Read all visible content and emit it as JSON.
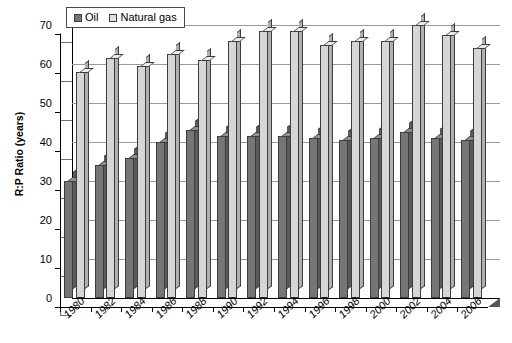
{
  "chart_data": {
    "type": "bar",
    "title": "",
    "subtitle": "",
    "xlabel": "",
    "ylabel": "R:P Ratio (years)",
    "ylim": [
      0,
      70
    ],
    "yticks": [
      0,
      10,
      20,
      30,
      40,
      50,
      60,
      70
    ],
    "grid": true,
    "legend_position": "top-left",
    "style": "3d-clustered-column",
    "categories": [
      "1980",
      "1982",
      "1984",
      "1986",
      "1988",
      "1990",
      "1992",
      "1994",
      "1996",
      "1998",
      "2000",
      "2002",
      "2004",
      "2006"
    ],
    "series": [
      {
        "name": "Oil",
        "color": "#767676",
        "values": [
          30,
          34,
          36,
          40,
          43,
          41.5,
          41.5,
          41.5,
          41,
          40.5,
          41,
          42.5,
          41,
          40.5
        ]
      },
      {
        "name": "Natural gas",
        "color": "#d6d6d6",
        "values": [
          58,
          61.5,
          59.5,
          62.5,
          61,
          66,
          68.5,
          68.5,
          65,
          66,
          66,
          70,
          67.5,
          64
        ]
      }
    ]
  },
  "legend": {
    "items": [
      {
        "label": "Oil",
        "swatch": "oil"
      },
      {
        "label": "Natural gas",
        "swatch": "gas"
      }
    ]
  },
  "axes": {
    "y_title": "R:P Ratio (years)",
    "y_tick_labels": [
      "70",
      "60",
      "50",
      "40",
      "30",
      "20",
      "10",
      "0"
    ],
    "x_tick_labels": [
      "1980",
      "1982",
      "1984",
      "1986",
      "1988",
      "1990",
      "1992",
      "1994",
      "1996",
      "1998",
      "2000",
      "2002",
      "2004",
      "2006"
    ]
  },
  "colors": {
    "oil_face": "#767676",
    "oil_side": "#5a5a5a",
    "oil_top": "#8f8f8f",
    "gas_face": "#d6d6d6",
    "gas_side": "#b0b0b0",
    "gas_top": "#ebebeb",
    "gridline": "#9a9a9a",
    "axis": "#000000",
    "background": "#ffffff"
  }
}
